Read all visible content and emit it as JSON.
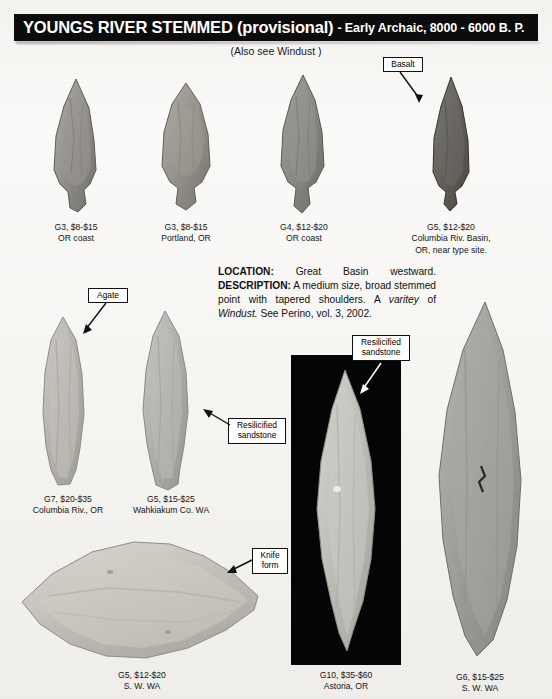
{
  "header": {
    "title_main": "YOUNGS RIVER STEMMED (provisional)",
    "title_sub": "- Early Archaic, 8000 - 6000 B. P.",
    "subtitle": "(Also see Windust )"
  },
  "description": {
    "location_label": "LOCATION:",
    "location_text": "Great Basin westward.",
    "description_label": "DESCRIPTION:",
    "description_text_1": "A medium size, broad stemmed point with tapered shoulders. A ",
    "variety_word": "varitey",
    "description_text_2": " of ",
    "reference_italic": "Windust.",
    "description_text_3": " See Perino, vol. 3, 2002."
  },
  "callouts": [
    {
      "id": "basalt",
      "label": "Basalt"
    },
    {
      "id": "agate",
      "label": "Agate"
    },
    {
      "id": "resilicified-sandstone-left",
      "label": "Resilicified\nsandstone"
    },
    {
      "id": "resilicified-sandstone-right",
      "label": "Resilicified\nsandstone"
    },
    {
      "id": "knife-form",
      "label": "Knife\nform"
    }
  ],
  "artifacts": [
    {
      "id": "artifact-1",
      "grade": "G3",
      "price": "$8-$15",
      "origin": "OR coast",
      "caption": "G3, $8-$15\nOR coast"
    },
    {
      "id": "artifact-2",
      "grade": "G3",
      "price": "$8-$15",
      "origin": "Portland, OR",
      "caption": "G3, $8-$15\nPortland, OR"
    },
    {
      "id": "artifact-3",
      "grade": "G4",
      "price": "$12-$20",
      "origin": "OR coast",
      "caption": "G4, $12-$20\nOR coast"
    },
    {
      "id": "artifact-4",
      "grade": "G5",
      "price": "$12-$20",
      "origin": "Columbia Riv. Basin, OR, near type site.",
      "caption": "G5, $12-$20\nColumbia Riv. Basin,\nOR, near type site."
    },
    {
      "id": "artifact-5",
      "grade": "G7",
      "price": "$20-$35",
      "origin": "Columbia Riv., OR",
      "caption": "G7, $20-$35\nColumbia Riv., OR"
    },
    {
      "id": "artifact-6",
      "grade": "G5",
      "price": "$15-$25",
      "origin": "Wahkiakum Co. WA",
      "caption": "G5, $15-$25\nWahkiakum Co. WA"
    },
    {
      "id": "artifact-7",
      "grade": "G5",
      "price": "$12-$20",
      "origin": "S. W. WA",
      "caption": "G5, $12-$20\nS. W. WA"
    },
    {
      "id": "artifact-8",
      "grade": "G10",
      "price": "$35-$60",
      "origin": "Astoria, OR",
      "caption": "G10, $35-$60\nAstoria, OR"
    },
    {
      "id": "artifact-9",
      "grade": "G6",
      "price": "$15-$25",
      "origin": "S. W. WA",
      "caption": "G6, $15-$25\nS. W. WA"
    }
  ],
  "colors": {
    "title_bar": "#0c0c0c",
    "page": "#f6f5f2",
    "panel": "#050505",
    "text": "#111111"
  }
}
